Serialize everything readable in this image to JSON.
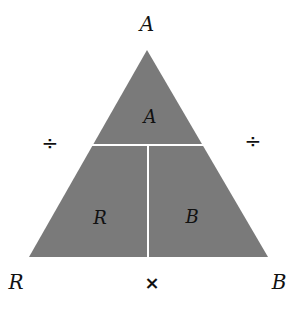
{
  "diagram": {
    "type": "formula-triangle",
    "fill_color": "#7a7a7a",
    "divider_color": "#ffffff",
    "outer_labels": {
      "top": "A",
      "bottom_left": "R",
      "bottom_right": "B"
    },
    "inner_labels": {
      "top": "A",
      "bottom_left": "R",
      "bottom_right": "B"
    },
    "operators": {
      "left": "÷",
      "right": "÷",
      "bottom": "×"
    }
  }
}
